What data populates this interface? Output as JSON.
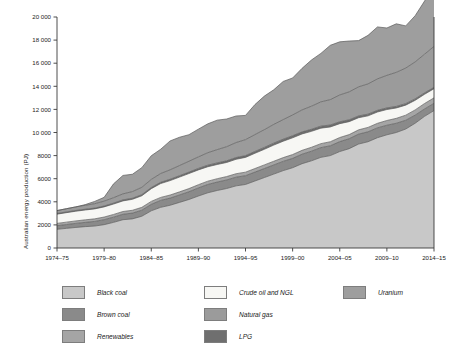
{
  "chart_data": {
    "type": "area",
    "stacked": true,
    "title": "",
    "xlabel": "",
    "ylabel": "Australian energy production (PJ)",
    "ylim": [
      0,
      20000
    ],
    "ytick_step": 2000,
    "ytick_labels": [
      "0",
      "2000",
      "4000",
      "6000",
      "8000",
      "10 000",
      "12 000",
      "14 000",
      "16 000",
      "18 000",
      "20 000"
    ],
    "ytick_values": [
      0,
      2000,
      4000,
      6000,
      8000,
      10000,
      12000,
      14000,
      16000,
      18000,
      20000
    ],
    "grid": false,
    "legend_position": "below",
    "x": [
      "1974-75",
      "1975-76",
      "1976-77",
      "1977-78",
      "1978-79",
      "1979-80",
      "1980-81",
      "1981-82",
      "1982-83",
      "1983-84",
      "1984-85",
      "1985-86",
      "1986-87",
      "1987-88",
      "1988-89",
      "1989-90",
      "1990-91",
      "1991-92",
      "1992-93",
      "1993-94",
      "1994-95",
      "1995-96",
      "1996-97",
      "1997-98",
      "1998-99",
      "1999-00",
      "2000-01",
      "2001-02",
      "2002-03",
      "2003-04",
      "2004-05",
      "2005-06",
      "2006-07",
      "2007-08",
      "2008-09",
      "2009-10",
      "2010-11",
      "2011-12",
      "2012-13",
      "2013-14",
      "2014-15"
    ],
    "xtick_labels": [
      "1974-75",
      "1979-80",
      "1984-85",
      "1989-90",
      "1994-95",
      "1999-00",
      "2004-05",
      "2009-10",
      "2014-15"
    ],
    "xtick_indices": [
      0,
      5,
      10,
      15,
      20,
      25,
      30,
      35,
      40
    ],
    "series": [
      {
        "name": "Black coal",
        "color": "#c8c8c8",
        "values": [
          1620,
          1700,
          1780,
          1850,
          1900,
          2020,
          2220,
          2450,
          2520,
          2750,
          3220,
          3520,
          3700,
          3950,
          4200,
          4500,
          4780,
          4980,
          5150,
          5380,
          5500,
          5800,
          6100,
          6400,
          6700,
          6950,
          7300,
          7550,
          7850,
          8000,
          8350,
          8600,
          9000,
          9200,
          9550,
          9800,
          10000,
          10300,
          10800,
          11400,
          11900
        ]
      },
      {
        "name": "Brown coal",
        "color": "#8a8a8a",
        "values": [
          310,
          330,
          350,
          370,
          400,
          430,
          450,
          470,
          500,
          520,
          560,
          600,
          620,
          640,
          670,
          700,
          720,
          730,
          740,
          750,
          760,
          770,
          780,
          790,
          800,
          810,
          820,
          830,
          840,
          850,
          860,
          860,
          860,
          860,
          850,
          830,
          800,
          760,
          700,
          640,
          620
        ]
      },
      {
        "name": "Renewables",
        "color": "#a5a5a5",
        "values": [
          200,
          210,
          215,
          220,
          225,
          230,
          235,
          240,
          245,
          250,
          255,
          260,
          265,
          270,
          275,
          280,
          285,
          290,
          295,
          300,
          305,
          310,
          315,
          320,
          325,
          330,
          335,
          340,
          345,
          350,
          355,
          360,
          370,
          380,
          395,
          410,
          425,
          440,
          455,
          470,
          480
        ]
      },
      {
        "name": "Crude oil and NGL",
        "color": "#f7f7f4",
        "values": [
          800,
          820,
          840,
          850,
          860,
          880,
          900,
          920,
          950,
          1000,
          1100,
          1200,
          1250,
          1280,
          1300,
          1280,
          1250,
          1230,
          1220,
          1250,
          1280,
          1320,
          1350,
          1400,
          1420,
          1450,
          1420,
          1380,
          1340,
          1280,
          1200,
          1120,
          1050,
          1000,
          980,
          950,
          900,
          870,
          830,
          800,
          790
        ]
      },
      {
        "name": "LPG",
        "color": "#6f6f6f",
        "values": [
          60,
          62,
          65,
          68,
          70,
          75,
          80,
          85,
          90,
          95,
          100,
          110,
          115,
          120,
          125,
          130,
          135,
          140,
          145,
          150,
          155,
          160,
          165,
          170,
          175,
          180,
          180,
          178,
          175,
          170,
          165,
          160,
          155,
          150,
          145,
          140,
          135,
          130,
          125,
          120,
          118
        ]
      },
      {
        "name": "Natural gas",
        "color": "#9b9b9b",
        "values": [
          250,
          280,
          310,
          340,
          380,
          420,
          470,
          520,
          580,
          640,
          700,
          760,
          820,
          880,
          940,
          1000,
          1080,
          1150,
          1220,
          1300,
          1380,
          1460,
          1540,
          1620,
          1700,
          1800,
          1900,
          2000,
          2100,
          2200,
          2320,
          2420,
          2520,
          2620,
          2720,
          2820,
          2950,
          3080,
          3200,
          3350,
          3550
        ]
      },
      {
        "name": "Uranium",
        "color": "#9e9e9e",
        "values": [
          0,
          0,
          0,
          60,
          200,
          330,
          1200,
          1600,
          1500,
          1700,
          2050,
          2100,
          2500,
          2450,
          2300,
          2400,
          2500,
          2550,
          2400,
          2300,
          2100,
          2600,
          2900,
          3000,
          3300,
          3200,
          3600,
          4000,
          4200,
          4700,
          4600,
          4400,
          4000,
          4200,
          4500,
          4100,
          4200,
          3650,
          4000,
          4600,
          5200
        ]
      }
    ]
  },
  "legend": {
    "columns": [
      {
        "items": [
          {
            "label": "Black coal",
            "color": "#c8c8c8",
            "name": "black-coal"
          },
          {
            "label": "Brown coal",
            "color": "#8a8a8a",
            "name": "brown-coal"
          },
          {
            "label": "Renewables",
            "color": "#a5a5a5",
            "name": "renewables"
          }
        ]
      },
      {
        "items": [
          {
            "label": "Crude oil and NGL",
            "color": "#f7f7f4",
            "name": "crude-oil-and-ngl"
          },
          {
            "label": "Natural gas",
            "color": "#9b9b9b",
            "name": "natural-gas"
          },
          {
            "label": "LPG",
            "color": "#6f6f6f",
            "name": "lpg"
          }
        ]
      },
      {
        "items": [
          {
            "label": "Uranium",
            "color": "#9e9e9e",
            "name": "uranium"
          }
        ]
      }
    ]
  }
}
